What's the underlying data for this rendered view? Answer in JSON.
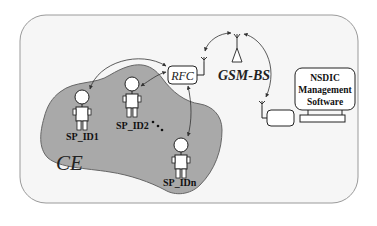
{
  "diagram": {
    "type": "network-architecture",
    "colors": {
      "background": "#ffffff",
      "frame_fill": "#f6f6f6",
      "frame_stroke": "#9a9a9a",
      "region_fill": "#a9a9a9",
      "region_stroke": "#666666",
      "line": "#333333"
    },
    "region": {
      "label": "CE"
    },
    "nodes": {
      "rfc": {
        "label": "RFC"
      },
      "gsm_bs": {
        "label": "GSM-BS"
      },
      "nsdic": {
        "line1": "NSDIC",
        "line2": "Management",
        "line3": "Software"
      },
      "persons": [
        {
          "id": "sp1",
          "label": "SP_ID1"
        },
        {
          "id": "sp2",
          "label": "SP_ID2"
        },
        {
          "id": "spn",
          "label": "SP_IDn"
        }
      ],
      "ellipsis": "•••"
    },
    "edges": [
      {
        "from": "SP_ID1",
        "to": "RFC",
        "type": "wireless-bidirectional"
      },
      {
        "from": "SP_ID2",
        "to": "RFC",
        "type": "wireless-bidirectional"
      },
      {
        "from": "SP_IDn",
        "to": "RFC",
        "type": "wireless-bidirectional"
      },
      {
        "from": "RFC",
        "to": "GSM-BS",
        "type": "wireless-bidirectional"
      },
      {
        "from": "GSM-BS",
        "to": "NSDIC Management Software",
        "type": "wireless-bidirectional"
      }
    ]
  }
}
